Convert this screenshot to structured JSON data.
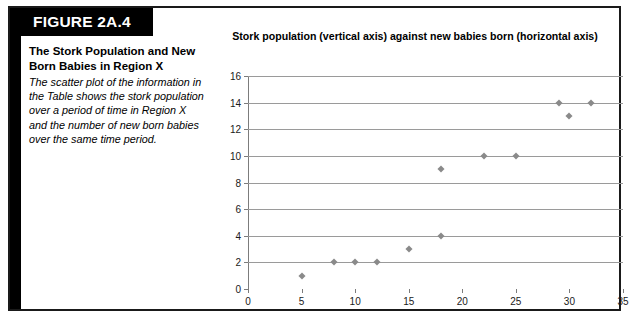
{
  "figure": {
    "banner_label": "FIGURE 2A.4",
    "caption_title": "The Stork Population and New Born Babies in Region X",
    "caption_body": "The scatter plot of the information in the Table shows the stork population over a period of time in Region X and the number of new born babies over the same time period."
  },
  "colors": {
    "banner_background": "#000000",
    "banner_text": "#ffffff",
    "frame_border": "#1a1a1a",
    "gridline": "#9a9a9a",
    "axis": "#7c7c7c",
    "marker": "#8a8a8a"
  },
  "chart_data": {
    "type": "scatter",
    "title": "Stork population (vertical axis) against new babies born (horizontal axis)",
    "xlabel": "",
    "ylabel": "",
    "xlim": [
      0,
      35
    ],
    "ylim": [
      0,
      16
    ],
    "xticks": [
      0,
      5,
      10,
      15,
      20,
      25,
      30,
      35
    ],
    "yticks": [
      0,
      2,
      4,
      6,
      8,
      10,
      12,
      14,
      16
    ],
    "grid": "horizontal",
    "legend": "none",
    "points": [
      {
        "x": 5,
        "y": 1
      },
      {
        "x": 8,
        "y": 2
      },
      {
        "x": 10,
        "y": 2
      },
      {
        "x": 12,
        "y": 2
      },
      {
        "x": 15,
        "y": 3
      },
      {
        "x": 18,
        "y": 4
      },
      {
        "x": 18,
        "y": 9
      },
      {
        "x": 22,
        "y": 10
      },
      {
        "x": 25,
        "y": 10
      },
      {
        "x": 29,
        "y": 14
      },
      {
        "x": 30,
        "y": 13
      },
      {
        "x": 32,
        "y": 14
      }
    ]
  }
}
